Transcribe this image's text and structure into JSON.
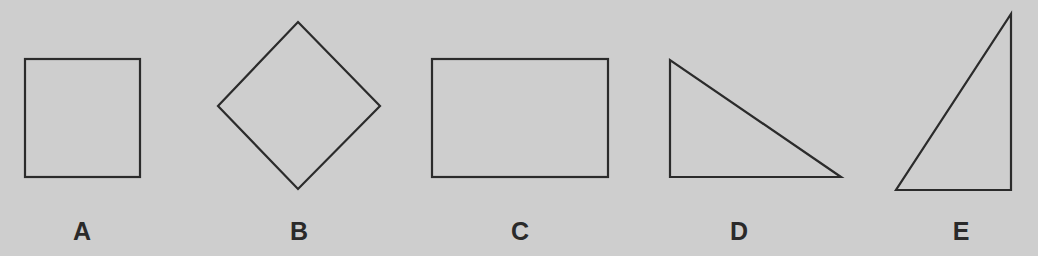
{
  "figure": {
    "background_color": "#cecece",
    "stroke_color": "#2b2b2b",
    "label_color": "#2a2a2a",
    "shapes": [
      {
        "id": "A",
        "label": "A",
        "kind": "square"
      },
      {
        "id": "B",
        "label": "B",
        "kind": "diamond (rotated square)"
      },
      {
        "id": "C",
        "label": "C",
        "kind": "rectangle"
      },
      {
        "id": "D",
        "label": "D",
        "kind": "right triangle (right angle bottom-left)"
      },
      {
        "id": "E",
        "label": "E",
        "kind": "right triangle (right angle bottom-right)"
      }
    ]
  }
}
